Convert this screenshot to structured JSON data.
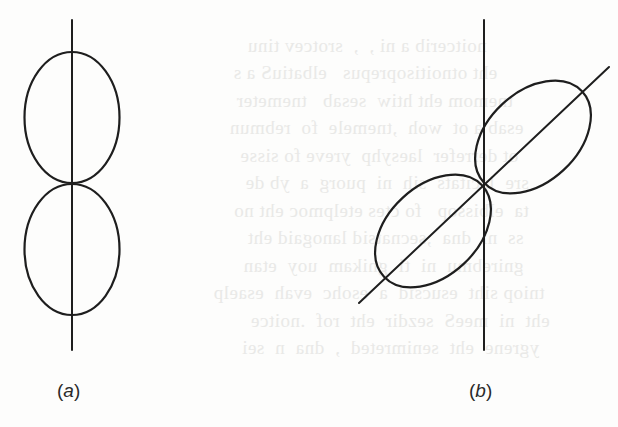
{
  "figure": {
    "panels": [
      {
        "id": "a",
        "label": "(a)",
        "description": "Two vertically aligned lobes touching at a point on a vertical axis",
        "axis": {
          "x": 72,
          "y1": 20,
          "y2": 350
        },
        "lobes": [
          {
            "cx": 72,
            "cy": 117,
            "rx": 47,
            "ry": 66
          },
          {
            "cx": 72,
            "cy": 249,
            "rx": 47,
            "ry": 66
          }
        ]
      },
      {
        "id": "b",
        "label": "(b)",
        "description": "Two lobes rotated along a diagonal axis, touching at a point on a vertical axis",
        "vertical_axis": {
          "x": 484,
          "y1": 20,
          "y2": 350
        },
        "diagonal_axis": {
          "x1": 359,
          "y1": 303,
          "x2": 609,
          "y2": 67
        },
        "rotation_deg": -43,
        "lobes": [
          {
            "cx": 534,
            "cy": 137,
            "rx": 68,
            "ry": 44
          },
          {
            "cx": 432,
            "cy": 232,
            "rx": 68,
            "ry": 44
          }
        ]
      }
    ],
    "stroke_color": "#1e1e1e",
    "background_color": "#fdfdfc"
  },
  "labels": {
    "a": "(a)",
    "b": "(b)"
  }
}
